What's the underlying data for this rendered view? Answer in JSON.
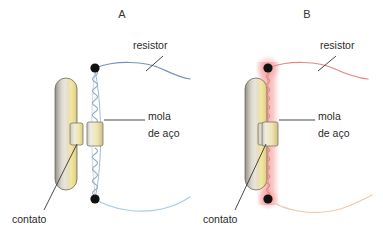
{
  "figure": {
    "width": 383,
    "height": 241,
    "background": "#ffffff"
  },
  "panels": [
    {
      "id": "A",
      "letter": "A",
      "letter_pos": {
        "x": 122,
        "y": 14
      },
      "state": "cold",
      "wire_color": "#7b94b5",
      "wire_color_lower": "#a8cde4",
      "spring_color": "#8fa9c4",
      "glow": false,
      "contact_closed": false,
      "labels": [
        {
          "name": "resistor",
          "text": "resistor",
          "x": 133,
          "y": 46
        },
        {
          "name": "spring",
          "text_line1": "mola",
          "text_line2": "de aço",
          "x": 148,
          "y": 116
        },
        {
          "name": "contact",
          "text": "contato",
          "x": 12,
          "y": 216
        }
      ],
      "geometry": {
        "post": {
          "x": 55,
          "y": 78,
          "w": 22,
          "h": 112
        },
        "contact_block": {
          "x": 70,
          "y": 123,
          "w": 13,
          "h": 22
        },
        "spring_axis_x": 95,
        "node_top": {
          "x": 95,
          "y": 68
        },
        "node_bottom": {
          "x": 95,
          "y": 199
        },
        "collar": {
          "x": 87,
          "y": 122,
          "w": 16,
          "h": 24
        }
      }
    },
    {
      "id": "B",
      "letter": "B",
      "letter_pos": {
        "x": 307,
        "y": 14
      },
      "state": "hot",
      "wire_color": "#e08b86",
      "wire_color_lower": "#f0c9ab",
      "spring_color": "#d98d84",
      "glow": true,
      "glow_color": "#f7b7b7",
      "contact_closed": true,
      "labels": [
        {
          "name": "resistor",
          "text": "resistor",
          "x": 320,
          "y": 46
        },
        {
          "name": "spring",
          "text_line1": "mola",
          "text_line2": "de aço",
          "x": 318,
          "y": 116
        },
        {
          "name": "contact",
          "text": "contato",
          "x": 203,
          "y": 216
        }
      ],
      "geometry": {
        "post": {
          "x": 245,
          "y": 78,
          "w": 22,
          "h": 112
        },
        "contact_block": {
          "x": 258,
          "y": 123,
          "w": 13,
          "h": 22
        },
        "spring_axis_x": 268,
        "node_top": {
          "x": 268,
          "y": 68
        },
        "node_bottom": {
          "x": 268,
          "y": 199
        },
        "collar": {
          "x": 262,
          "y": 122,
          "w": 16,
          "h": 24
        }
      }
    }
  ],
  "colors": {
    "post_gray": "#a9a39a",
    "post_light": "#e9e5de",
    "post_yellow": "#f3e7a8",
    "post_yellow_deep": "#e8d98c",
    "node_black": "#111111",
    "text": "#2b2b2b",
    "leader": "#333333",
    "glow_pink": "#f7b7b7"
  },
  "text": {
    "resistor": "resistor",
    "spring_line1": "mola",
    "spring_line2": "de aço",
    "contact": "contato",
    "letter_a": "A",
    "letter_b": "B"
  }
}
